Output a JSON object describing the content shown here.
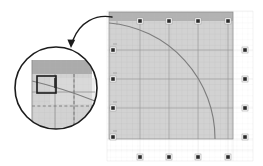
{
  "figure": {
    "title": "",
    "background_color": "#ffffff",
    "width": 263,
    "height": 166
  },
  "colors": {
    "page_background": "#ffffff",
    "plot_fill": "#cfcfcf",
    "plot_fill_light": "#e2e2e2",
    "header_band": "#b4b4b4",
    "grid_minor": "#bdbdbd",
    "grid_major": "#8d8d8d",
    "grid_faint": "#e6e6e6",
    "curve_stroke": "#7a7a7a",
    "handle_fill": "#2b2b2b",
    "handle_border": "#ffffff",
    "outline": "#8a8a8a",
    "magnifier_stroke": "#1c1c1c",
    "arrow_stroke": "#1c1c1c",
    "dashed_line": "#6f6f6f"
  },
  "plot_panel": {
    "name": "quarter-arc-plot",
    "x": 109,
    "y": 12,
    "width": 124,
    "height": 127,
    "header_band": {
      "label": "",
      "height": 9
    },
    "outer_frame": {
      "x": 107,
      "y": 11,
      "width": 146,
      "height": 150
    }
  },
  "selection_handles": {
    "label": "resize-handle",
    "size": 5,
    "top": [
      {
        "x": 140,
        "y": 21
      },
      {
        "x": 169,
        "y": 21
      },
      {
        "x": 198,
        "y": 21
      },
      {
        "x": 228,
        "y": 21
      }
    ],
    "left": [
      {
        "x": 113,
        "y": 50
      },
      {
        "x": 113,
        "y": 79
      },
      {
        "x": 113,
        "y": 108
      },
      {
        "x": 113,
        "y": 137
      }
    ],
    "right": [
      {
        "x": 245,
        "y": 50
      },
      {
        "x": 245,
        "y": 79
      },
      {
        "x": 245,
        "y": 108
      },
      {
        "x": 245,
        "y": 137
      }
    ],
    "bottom": [
      {
        "x": 140,
        "y": 157
      },
      {
        "x": 169,
        "y": 157
      },
      {
        "x": 198,
        "y": 157
      },
      {
        "x": 228,
        "y": 157
      }
    ]
  },
  "grid": {
    "major_columns": 4,
    "major_rows": 4,
    "minor_per_major": 5,
    "show_minor": true,
    "show_major": true
  },
  "curve": {
    "name": "quarter-circle-arc",
    "description": "quarter circle from upper-left to lower-right",
    "start": {
      "x": 109,
      "y": 23
    },
    "end": {
      "x": 215,
      "y": 139
    },
    "radius": 116,
    "stroke_width": 1
  },
  "magnifier": {
    "name": "detail-callout",
    "center": {
      "x": 56,
      "y": 88
    },
    "radius": 42,
    "stroke_width": 2,
    "detail": {
      "header_band_label": "",
      "handle_square": {
        "x": 30,
        "y": 58,
        "width": 22,
        "height": 20
      },
      "dashed_lines": 2,
      "gridlines": 3
    }
  },
  "arrow": {
    "name": "callout-arrow",
    "from": {
      "x": 112,
      "y": 17
    },
    "to": {
      "x": 71,
      "y": 47
    },
    "head_size": 6,
    "curved": true
  },
  "axis_ticks": {
    "top_labels": [
      "",
      "",
      "",
      ""
    ],
    "left_labels": [
      "",
      "",
      "",
      ""
    ],
    "right_labels": [
      "",
      "",
      "",
      ""
    ],
    "bottom_labels": [
      "",
      "",
      "",
      ""
    ]
  }
}
